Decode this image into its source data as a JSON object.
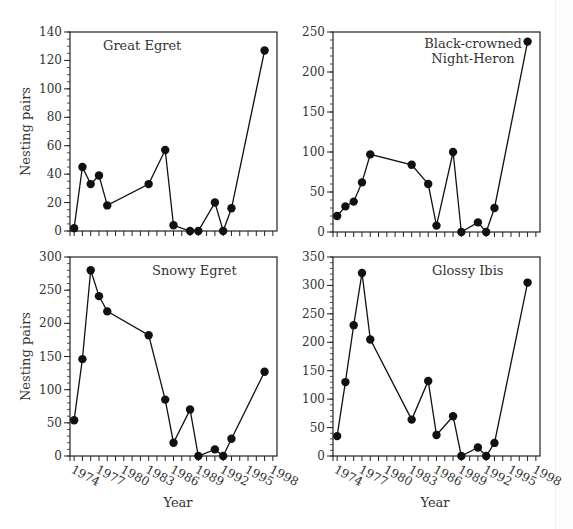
{
  "figure": {
    "x_axis_label": "Year",
    "y_axis_label": "Nesting pairs",
    "x_tick_labels": [
      "1974",
      "1977",
      "1980",
      "1983",
      "1986",
      "1989",
      "1992",
      "1995",
      "1998"
    ]
  },
  "chart_data": [
    {
      "type": "line",
      "title": "Great Egret",
      "xlabel": "Year",
      "ylabel": "Nesting pairs",
      "x": [
        1974,
        1975,
        1976,
        1977,
        1978,
        1983,
        1985,
        1986,
        1988,
        1989,
        1991,
        1992,
        1993,
        1997
      ],
      "values": [
        2,
        45,
        33,
        39,
        18,
        33,
        57,
        4,
        0,
        0,
        20,
        0,
        16,
        127
      ],
      "xlim": [
        1973.5,
        1998.5
      ],
      "ylim": [
        0,
        140
      ],
      "y_ticks": [
        0,
        20,
        40,
        60,
        80,
        100,
        120,
        140
      ],
      "y_minor_step": 5,
      "show_x_tick_labels": false,
      "show_y_label": true,
      "grid": false,
      "marker": "filled-circle"
    },
    {
      "type": "line",
      "title": "Black-crowned Night-Heron",
      "title_lines": [
        "Black-crowned",
        "Night-Heron"
      ],
      "xlabel": "Year",
      "ylabel": "",
      "x": [
        1974,
        1975,
        1976,
        1977,
        1978,
        1983,
        1985,
        1986,
        1988,
        1989,
        1991,
        1992,
        1993,
        1997
      ],
      "values": [
        20,
        32,
        38,
        62,
        97,
        84,
        60,
        8,
        100,
        0,
        12,
        0,
        30,
        238
      ],
      "xlim": [
        1973.5,
        1998.5
      ],
      "ylim": [
        0,
        250
      ],
      "y_ticks": [
        0,
        50,
        100,
        150,
        200,
        250
      ],
      "y_minor_step": 10,
      "show_x_tick_labels": false,
      "show_y_label": false,
      "grid": false,
      "marker": "filled-circle"
    },
    {
      "type": "line",
      "title": "Snowy Egret",
      "xlabel": "Year",
      "ylabel": "Nesting pairs",
      "x": [
        1974,
        1975,
        1976,
        1977,
        1978,
        1983,
        1985,
        1986,
        1988,
        1989,
        1991,
        1992,
        1993,
        1997
      ],
      "values": [
        54,
        146,
        280,
        241,
        218,
        182,
        85,
        20,
        70,
        0,
        10,
        0,
        26,
        127
      ],
      "xlim": [
        1973.5,
        1998.5
      ],
      "ylim": [
        0,
        300
      ],
      "y_ticks": [
        0,
        50,
        100,
        150,
        200,
        250,
        300
      ],
      "y_minor_step": 10,
      "show_x_tick_labels": true,
      "show_y_label": true,
      "grid": false,
      "marker": "filled-circle"
    },
    {
      "type": "line",
      "title": "Glossy Ibis",
      "xlabel": "Year",
      "ylabel": "",
      "x": [
        1974,
        1975,
        1976,
        1977,
        1978,
        1983,
        1985,
        1986,
        1988,
        1989,
        1991,
        1992,
        1993,
        1997
      ],
      "values": [
        35,
        130,
        230,
        322,
        205,
        64,
        132,
        37,
        70,
        0,
        15,
        0,
        23,
        305
      ],
      "xlim": [
        1973.5,
        1998.5
      ],
      "ylim": [
        0,
        350
      ],
      "y_ticks": [
        0,
        50,
        100,
        150,
        200,
        250,
        300,
        350
      ],
      "y_minor_step": 10,
      "show_x_tick_labels": true,
      "show_y_label": false,
      "grid": false,
      "marker": "filled-circle"
    }
  ],
  "panels_layout": [
    {
      "left": 70,
      "top": 32,
      "right": 277,
      "bottom": 231,
      "title_x": 103,
      "title_y": 50
    },
    {
      "left": 333,
      "top": 32,
      "right": 540,
      "bottom": 232,
      "title_x": 473,
      "title_y": 48
    },
    {
      "left": 70,
      "top": 257,
      "right": 277,
      "bottom": 456,
      "title_x": 152,
      "title_y": 275
    },
    {
      "left": 333,
      "top": 257,
      "right": 540,
      "bottom": 456,
      "title_x": 432,
      "title_y": 275
    }
  ],
  "colors": {
    "axis": "#222222",
    "line": "#111111",
    "marker": "#111111",
    "text": "#333333",
    "background": "#ffffff"
  }
}
